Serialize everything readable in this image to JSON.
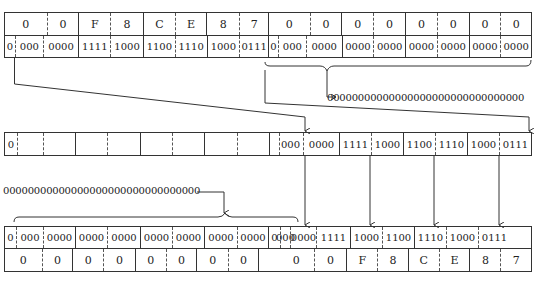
{
  "diagram": {
    "top": {
      "hex_cells": [
        "0",
        "0",
        "F",
        "8",
        "C",
        "E",
        "8",
        "7",
        "0",
        "0",
        "0",
        "0",
        "0",
        "0",
        "0",
        "0"
      ],
      "bin_cells": [
        "0",
        "000",
        "0000",
        "1111",
        "1000",
        "1100",
        "1110",
        "1000",
        "0111",
        "0",
        "000",
        "0000",
        "0000",
        "0000",
        "0000",
        "0000",
        "0000",
        "0000"
      ]
    },
    "mantissa_zeros_label": "00000000000000000000000000000000",
    "middle": {
      "bin_cells": [
        "0",
        "",
        "",
        "",
        "",
        "",
        "",
        "",
        "",
        "000",
        "0000",
        "1111",
        "1000",
        "1100",
        "1110",
        "1000",
        "0111"
      ]
    },
    "exponent_zeros_label": "00000000000000000000000000000000",
    "bottom": {
      "bin_cells": [
        "0",
        "000",
        "0000",
        "0000",
        "0000",
        "0000",
        "0000",
        "0000",
        "0000",
        "0",
        "000",
        "0000",
        "1111",
        "1000",
        "1100",
        "1110",
        "1000",
        "0111"
      ],
      "hex_cells": [
        "0",
        "0",
        "0",
        "0",
        "0",
        "0",
        "0",
        "0",
        "",
        "0",
        "0",
        "F",
        "8",
        "C",
        "E",
        "8",
        "7"
      ]
    }
  }
}
